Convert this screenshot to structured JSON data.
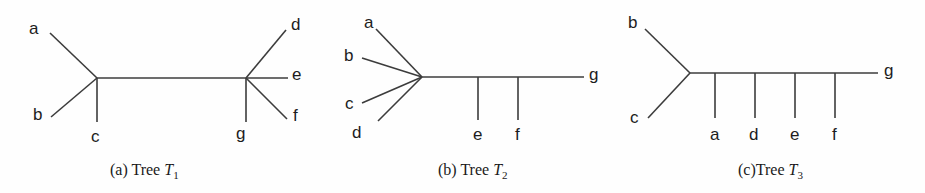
{
  "figure": {
    "background_color": "#fefefe",
    "line_color": "#3c3c3c",
    "text_color": "#1d1d1d",
    "width": 925,
    "height": 193
  },
  "panels": [
    {
      "id": "tree-t1",
      "caption_prefix": "(a) ",
      "caption_word": "Tree ",
      "caption_var": "T",
      "caption_sub": "1",
      "caption_x": 110,
      "caption_y": 162,
      "labels": [
        {
          "name": "a",
          "text": "a",
          "x": 29,
          "y": 20
        },
        {
          "name": "b",
          "text": "b",
          "x": 33,
          "y": 106
        },
        {
          "name": "c",
          "text": "c",
          "x": 91,
          "y": 128
        },
        {
          "name": "d",
          "text": "d",
          "x": 291,
          "y": 16
        },
        {
          "name": "e",
          "text": "e",
          "x": 292,
          "y": 66
        },
        {
          "name": "f",
          "text": "f",
          "x": 293,
          "y": 107
        },
        {
          "name": "g",
          "text": "g",
          "x": 236,
          "y": 125
        }
      ],
      "edges": [
        {
          "name": "edge-a",
          "x1": 50,
          "y1": 33,
          "x2": 97,
          "y2": 78
        },
        {
          "name": "edge-b",
          "x1": 51,
          "y1": 117,
          "x2": 97,
          "y2": 78
        },
        {
          "name": "edge-c",
          "x1": 97,
          "y1": 78,
          "x2": 97,
          "y2": 122
        },
        {
          "name": "edge-internal",
          "x1": 97,
          "y1": 78,
          "x2": 246,
          "y2": 78
        },
        {
          "name": "edge-d",
          "x1": 246,
          "y1": 78,
          "x2": 286,
          "y2": 30
        },
        {
          "name": "edge-e",
          "x1": 246,
          "y1": 78,
          "x2": 288,
          "y2": 78
        },
        {
          "name": "edge-f",
          "x1": 246,
          "y1": 78,
          "x2": 287,
          "y2": 119
        },
        {
          "name": "edge-g",
          "x1": 246,
          "y1": 78,
          "x2": 246,
          "y2": 122
        }
      ]
    },
    {
      "id": "tree-t2",
      "caption_prefix": "(b) ",
      "caption_word": "Tree ",
      "caption_var": "T",
      "caption_sub": "2",
      "caption_x": 438,
      "caption_y": 162,
      "labels": [
        {
          "name": "a",
          "text": "a",
          "x": 364,
          "y": 14
        },
        {
          "name": "b",
          "text": "b",
          "x": 344,
          "y": 47
        },
        {
          "name": "c",
          "text": "c",
          "x": 345,
          "y": 95
        },
        {
          "name": "d",
          "text": "d",
          "x": 352,
          "y": 124
        },
        {
          "name": "e",
          "text": "e",
          "x": 473,
          "y": 126
        },
        {
          "name": "f",
          "text": "f",
          "x": 515,
          "y": 126
        },
        {
          "name": "g",
          "text": "g",
          "x": 589,
          "y": 66
        }
      ],
      "edges": [
        {
          "name": "edge-a",
          "x1": 376,
          "y1": 29,
          "x2": 422,
          "y2": 77
        },
        {
          "name": "edge-b",
          "x1": 362,
          "y1": 58,
          "x2": 422,
          "y2": 77
        },
        {
          "name": "edge-c",
          "x1": 362,
          "y1": 103,
          "x2": 422,
          "y2": 77
        },
        {
          "name": "edge-d",
          "x1": 378,
          "y1": 121,
          "x2": 422,
          "y2": 77
        },
        {
          "name": "edge-spine",
          "x1": 422,
          "y1": 77,
          "x2": 584,
          "y2": 77
        },
        {
          "name": "edge-e",
          "x1": 478,
          "y1": 77,
          "x2": 478,
          "y2": 120
        },
        {
          "name": "edge-f",
          "x1": 518,
          "y1": 77,
          "x2": 518,
          "y2": 120
        }
      ]
    },
    {
      "id": "tree-t3",
      "caption_prefix": "(c)",
      "caption_word": "Tree ",
      "caption_var": "T",
      "caption_sub": "3",
      "caption_x": 738,
      "caption_y": 162,
      "labels": [
        {
          "name": "b",
          "text": "b",
          "x": 628,
          "y": 14
        },
        {
          "name": "c",
          "text": "c",
          "x": 630,
          "y": 109
        },
        {
          "name": "a",
          "text": "a",
          "x": 710,
          "y": 126
        },
        {
          "name": "d",
          "text": "d",
          "x": 749,
          "y": 126
        },
        {
          "name": "e",
          "text": "e",
          "x": 790,
          "y": 126
        },
        {
          "name": "f",
          "text": "f",
          "x": 832,
          "y": 126
        },
        {
          "name": "g",
          "text": "g",
          "x": 884,
          "y": 62
        }
      ],
      "edges": [
        {
          "name": "edge-b",
          "x1": 645,
          "y1": 29,
          "x2": 690,
          "y2": 73
        },
        {
          "name": "edge-c",
          "x1": 648,
          "y1": 118,
          "x2": 690,
          "y2": 73
        },
        {
          "name": "edge-spine",
          "x1": 690,
          "y1": 73,
          "x2": 878,
          "y2": 73
        },
        {
          "name": "edge-a",
          "x1": 715,
          "y1": 73,
          "x2": 715,
          "y2": 118
        },
        {
          "name": "edge-d",
          "x1": 755,
          "y1": 73,
          "x2": 755,
          "y2": 118
        },
        {
          "name": "edge-e",
          "x1": 795,
          "y1": 73,
          "x2": 795,
          "y2": 118
        },
        {
          "name": "edge-f",
          "x1": 835,
          "y1": 73,
          "x2": 835,
          "y2": 118
        }
      ]
    }
  ]
}
